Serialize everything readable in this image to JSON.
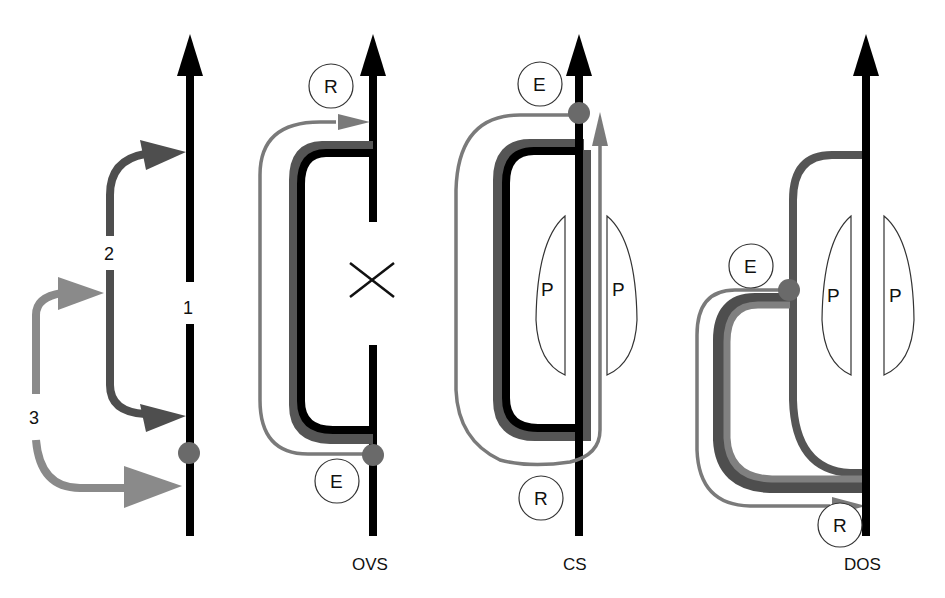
{
  "colors": {
    "strand": "#000000",
    "dark_gray": "#4a4a4a",
    "mid_gray": "#6e6e6e",
    "light_gray": "#858585",
    "dot": "#6a6a6a",
    "outline": "#222222",
    "background": "#ffffff"
  },
  "panel1": {
    "labels": {
      "n1": "1",
      "n2": "2",
      "n3": "3"
    }
  },
  "panel2": {
    "title": "OVS",
    "circle_top": "R",
    "circle_bottom": "E",
    "cross_mark": "×"
  },
  "panel3": {
    "title": "CS",
    "circle_top": "E",
    "circle_bottom": "R",
    "left_lobe": "P",
    "right_lobe": "P"
  },
  "panel4": {
    "title": "DOS",
    "circle_left": "E",
    "circle_bottom": "R",
    "left_lobe": "P",
    "right_lobe": "P"
  }
}
